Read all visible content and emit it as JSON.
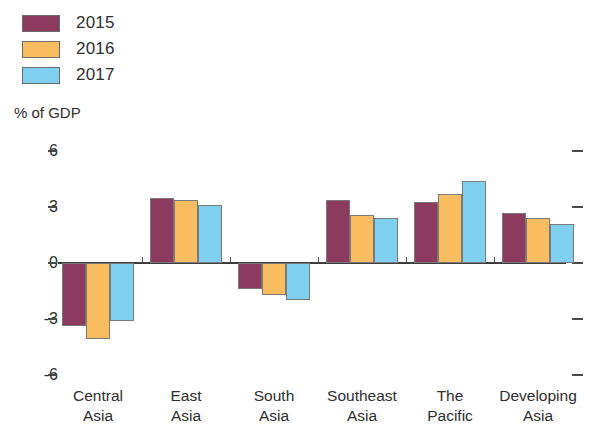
{
  "axis_title": "% of GDP",
  "legend": {
    "items": [
      {
        "label": "2015",
        "color": "#8C3A5E"
      },
      {
        "label": "2016",
        "color": "#F9BC60"
      },
      {
        "label": "2017",
        "color": "#7FD0EF"
      }
    ]
  },
  "chart_data": {
    "type": "bar",
    "title": "",
    "subtitle": "",
    "xlabel": "",
    "ylabel": "% of GDP",
    "ylim": [
      -6,
      6
    ],
    "yticks": [
      6,
      3,
      0,
      -3,
      -6
    ],
    "ytick_labels": [
      "6",
      "3",
      "0",
      "-3",
      "-6"
    ],
    "grid": false,
    "legend_position": "top-left",
    "categories": [
      "Central\nAsia",
      "East\nAsia",
      "South\nAsia",
      "Southeast\nAsia",
      "The\nPacific",
      "Developing\nAsia"
    ],
    "category_lines": [
      [
        "Central",
        "Asia"
      ],
      [
        "East",
        "Asia"
      ],
      [
        "South",
        "Asia"
      ],
      [
        "Southeast",
        "Asia"
      ],
      [
        "The",
        "Pacific"
      ],
      [
        "Developing",
        "Asia"
      ]
    ],
    "series": [
      {
        "name": "2015",
        "color": "#8C3A5E",
        "values": [
          -3.4,
          3.5,
          -1.4,
          3.4,
          3.3,
          2.7
        ]
      },
      {
        "name": "2016",
        "color": "#F9BC60",
        "values": [
          -4.1,
          3.4,
          -1.7,
          2.6,
          3.7,
          2.4
        ]
      },
      {
        "name": "2017",
        "color": "#7FD0EF",
        "values": [
          -3.1,
          3.1,
          -2.0,
          2.4,
          4.4,
          2.1
        ]
      }
    ]
  },
  "colors": {
    "series_2015": "#8C3A5E",
    "series_2016": "#F9BC60",
    "series_2017": "#7FD0EF",
    "axis": "#3d3d3d",
    "text": "#2e2e2e",
    "background": "#ffffff"
  }
}
